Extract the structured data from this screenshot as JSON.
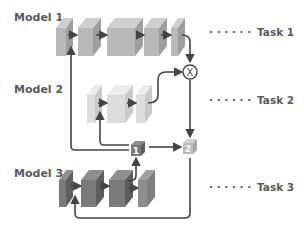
{
  "models": [
    {
      "label": "Model 1",
      "task": "Task 1",
      "color_front": "#b8b8b8",
      "color_side": "#9e9e9e",
      "color_top": "#cfcfcf"
    },
    {
      "label": "Model 2",
      "task": "Task 2",
      "color_front": "#dcdcdc",
      "color_side": "#cacaca",
      "color_top": "#ececec"
    },
    {
      "label": "Model 3",
      "task": "Task 3",
      "color_front": "#7a7a7a",
      "color_side": "#5e5e5e",
      "color_top": "#8f8f8f"
    }
  ],
  "task_dots": "· · · · · ·",
  "nodes": {
    "box1": {
      "label": "1",
      "color": "#7a7a7a"
    },
    "box2": {
      "label": "2",
      "color": "#bdbdbd"
    },
    "multiply": {
      "label": "X"
    }
  }
}
